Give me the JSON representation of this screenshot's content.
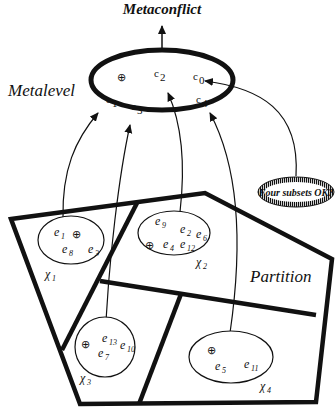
{
  "diagram": {
    "top_label": "Metaconflict",
    "metalevel": {
      "label": "Metalevel",
      "constraints": [
        {
          "base": "c",
          "sub": "0"
        },
        {
          "base": "c",
          "sub": "1"
        },
        {
          "base": "c",
          "sub": "2"
        },
        {
          "base": "c",
          "sub": "3"
        },
        {
          "base": "c",
          "sub": "4"
        }
      ],
      "symbol": "⊕"
    },
    "check_node": "Four subsets OK?",
    "partition_label": "Partition",
    "subsets": [
      {
        "name": "χ",
        "sub": "1",
        "elements": [
          {
            "b": "e",
            "s": "1"
          },
          {
            "b": "e",
            "s": "8"
          },
          {
            "b": "e",
            "s": "3"
          }
        ],
        "symbol": "⊕",
        "target": "c1"
      },
      {
        "name": "χ",
        "sub": "2",
        "elements": [
          {
            "b": "e",
            "s": "9"
          },
          {
            "b": "e",
            "s": "2"
          },
          {
            "b": "e",
            "s": "6"
          },
          {
            "b": "e",
            "s": "4"
          },
          {
            "b": "e",
            "s": "12"
          }
        ],
        "symbol": "⊕",
        "target": "c2"
      },
      {
        "name": "χ",
        "sub": "3",
        "elements": [
          {
            "b": "e",
            "s": "13"
          },
          {
            "b": "e",
            "s": "10"
          },
          {
            "b": "e",
            "s": "7"
          }
        ],
        "symbol": "⊕",
        "target": "c3"
      },
      {
        "name": "χ",
        "sub": "4",
        "elements": [
          {
            "b": "e",
            "s": "5"
          },
          {
            "b": "e",
            "s": "11"
          }
        ],
        "symbol": "⊕",
        "target": "c4"
      }
    ],
    "edges": [
      {
        "from": "χ1",
        "to": "c1"
      },
      {
        "from": "χ3",
        "to": "c3"
      },
      {
        "from": "χ2",
        "to": "c2"
      },
      {
        "from": "χ4",
        "to": "c4"
      },
      {
        "from": "Four subsets OK?",
        "to": "c0"
      },
      {
        "from": "Metalevel",
        "to": "Metaconflict"
      }
    ]
  }
}
